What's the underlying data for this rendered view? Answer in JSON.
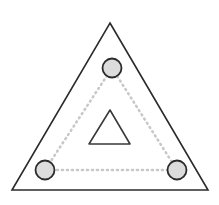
{
  "figure": {
    "name": "triangle-with-three-nodes",
    "canvas": {
      "width": 219,
      "height": 205,
      "background": "#ffffff"
    },
    "colors": {
      "outline": "#2b2b2b",
      "inner_outline": "#3a3a3a",
      "node_stroke": "#2b2b2b",
      "node_fill": "#dcdcdc",
      "dotted_guide": "#c8c8c8",
      "background": "#ffffff"
    },
    "outer_triangle": {
      "label": "outer-triangle",
      "points": "110,23 208,190 12,190",
      "stroke_width": 1.6,
      "fill": "none"
    },
    "inner_triangle": {
      "label": "inner-triangle",
      "points": "110,110 130,144 89,144",
      "stroke_width": 1.6,
      "corner_radius": 4,
      "fill": "none"
    },
    "guide_triangle": {
      "label": "dotted-guide-triangle",
      "points": "112,68 177,170 45,170",
      "stroke_width": 2.6,
      "dash": "1 4"
    },
    "nodes": [
      {
        "id": "node-top",
        "label": "top-node",
        "cx": 112,
        "cy": 68,
        "r": 9.5
      },
      {
        "id": "node-bottom-left",
        "label": "bottom-left-node",
        "cx": 45,
        "cy": 170,
        "r": 9.5
      },
      {
        "id": "node-bottom-right",
        "label": "bottom-right-node",
        "cx": 177,
        "cy": 170,
        "r": 9.5
      }
    ]
  }
}
